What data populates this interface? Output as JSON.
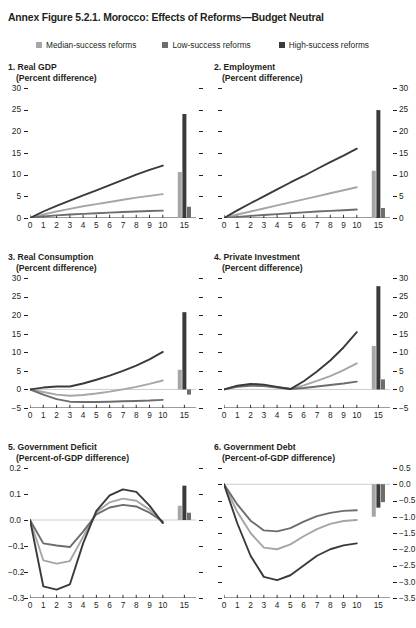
{
  "figure": {
    "title": "Annex Figure 5.2.1. Morocco: Effects of Reforms—Budget Neutral"
  },
  "legend": {
    "items": [
      {
        "label": "Median-success reforms",
        "color": "#a6a6a6",
        "key": "median"
      },
      {
        "label": "Low-success reforms",
        "color": "#6d6d6d",
        "key": "low"
      },
      {
        "label": "High-success reforms",
        "color": "#3a3a3a",
        "key": "high"
      }
    ]
  },
  "colors": {
    "median": "#a6a6a6",
    "low": "#6d6d6d",
    "high": "#3a3a3a",
    "axis": "#231f20",
    "zeroline": "#bfbfbf"
  },
  "chart_data": [
    {
      "type": "line",
      "panel": 1,
      "title": "1. Real GDP",
      "subtitle": "(Percent difference)",
      "xlabel": "",
      "ylabel": "",
      "ylim": [
        0,
        30
      ],
      "yticks": [
        0,
        5,
        10,
        15,
        20,
        25,
        30
      ],
      "ytick_labels": [
        "0",
        "5",
        "10",
        "15",
        "20",
        "25",
        "30"
      ],
      "axis_side": "left",
      "x": [
        0,
        1,
        2,
        3,
        4,
        5,
        6,
        7,
        8,
        9,
        10
      ],
      "xtick_labels": [
        "0",
        "1",
        "2",
        "3",
        "4",
        "5",
        "6",
        "7",
        "8",
        "9",
        "10",
        "15"
      ],
      "grid": false,
      "zero_line": false,
      "series": [
        {
          "name": "High-success reforms",
          "key": "high",
          "values": [
            0,
            1.5,
            2.8,
            4.0,
            5.2,
            6.4,
            7.6,
            8.8,
            10.0,
            11.1,
            12.1
          ]
        },
        {
          "name": "Median-success reforms",
          "key": "median",
          "values": [
            0,
            0.8,
            1.5,
            2.1,
            2.7,
            3.2,
            3.7,
            4.2,
            4.7,
            5.1,
            5.5
          ]
        },
        {
          "name": "Low-success reforms",
          "key": "low",
          "values": [
            0,
            0.35,
            0.6,
            0.8,
            0.95,
            1.1,
            1.25,
            1.4,
            1.5,
            1.6,
            1.7
          ]
        }
      ],
      "bars": {
        "x_label": "15",
        "values": [
          {
            "key": "median",
            "value": 10.6
          },
          {
            "key": "high",
            "value": 24.0
          },
          {
            "key": "low",
            "value": 2.6
          }
        ]
      }
    },
    {
      "type": "line",
      "panel": 2,
      "title": "2. Employment",
      "subtitle": "(Percent difference)",
      "xlabel": "",
      "ylabel": "",
      "ylim": [
        0,
        30
      ],
      "yticks": [
        0,
        5,
        10,
        15,
        20,
        25,
        30
      ],
      "ytick_labels": [
        "0",
        "5",
        "10",
        "15",
        "20",
        "25",
        "30"
      ],
      "axis_side": "right",
      "x": [
        0,
        1,
        2,
        3,
        4,
        5,
        6,
        7,
        8,
        9,
        10
      ],
      "xtick_labels": [
        "0",
        "1",
        "2",
        "3",
        "4",
        "5",
        "6",
        "7",
        "8",
        "9",
        "10",
        "15"
      ],
      "grid": false,
      "zero_line": false,
      "series": [
        {
          "name": "High-success reforms",
          "key": "high",
          "values": [
            0,
            1.75,
            3.4,
            5.0,
            6.6,
            8.2,
            9.7,
            11.3,
            12.9,
            14.4,
            16.0
          ]
        },
        {
          "name": "Median-success reforms",
          "key": "median",
          "values": [
            0,
            0.8,
            1.5,
            2.2,
            2.9,
            3.6,
            4.3,
            5.0,
            5.7,
            6.4,
            7.1
          ]
        },
        {
          "name": "Low-success reforms",
          "key": "low",
          "values": [
            0,
            0.25,
            0.5,
            0.7,
            0.9,
            1.1,
            1.3,
            1.5,
            1.65,
            1.8,
            1.95
          ]
        }
      ],
      "bars": {
        "x_label": "15",
        "values": [
          {
            "key": "median",
            "value": 10.9
          },
          {
            "key": "high",
            "value": 24.9
          },
          {
            "key": "low",
            "value": 2.3
          }
        ]
      }
    },
    {
      "type": "line",
      "panel": 3,
      "title": "3. Real Consumption",
      "subtitle": "(Percent difference)",
      "xlabel": "",
      "ylabel": "",
      "ylim": [
        -5,
        30
      ],
      "yticks": [
        -5,
        0,
        5,
        10,
        15,
        20,
        25,
        30
      ],
      "ytick_labels": [
        "-5",
        "0",
        "5",
        "10",
        "15",
        "20",
        "25",
        "30"
      ],
      "axis_side": "left",
      "x": [
        0,
        1,
        2,
        3,
        4,
        5,
        6,
        7,
        8,
        9,
        10
      ],
      "xtick_labels": [
        "0",
        "1",
        "2",
        "3",
        "4",
        "5",
        "6",
        "7",
        "8",
        "9",
        "10",
        "15"
      ],
      "grid": false,
      "zero_line": true,
      "series": [
        {
          "name": "High-success reforms",
          "key": "high",
          "values": [
            0,
            0.5,
            0.8,
            0.8,
            1.6,
            2.6,
            3.7,
            5.0,
            6.4,
            8.1,
            10.1
          ]
        },
        {
          "name": "Median-success reforms",
          "key": "median",
          "values": [
            0,
            -0.7,
            -1.4,
            -1.7,
            -1.5,
            -1.1,
            -0.6,
            0.0,
            0.7,
            1.5,
            2.4
          ]
        },
        {
          "name": "Low-success reforms",
          "key": "low",
          "values": [
            0,
            -1.4,
            -2.6,
            -3.3,
            -3.4,
            -3.4,
            -3.3,
            -3.2,
            -3.1,
            -3.0,
            -2.8
          ]
        }
      ],
      "bars": {
        "x_label": "15",
        "values": [
          {
            "key": "median",
            "value": 5.3
          },
          {
            "key": "high",
            "value": 20.8
          },
          {
            "key": "low",
            "value": -1.4
          }
        ]
      }
    },
    {
      "type": "line",
      "panel": 4,
      "title": "4. Private Investment",
      "subtitle": "(Percent difference)",
      "xlabel": "",
      "ylabel": "",
      "ylim": [
        -5,
        30
      ],
      "yticks": [
        -5,
        0,
        5,
        10,
        15,
        20,
        25,
        30
      ],
      "ytick_labels": [
        "-5",
        "0",
        "5",
        "10",
        "15",
        "20",
        "25",
        "30"
      ],
      "axis_side": "right",
      "x": [
        0,
        1,
        2,
        3,
        4,
        5,
        6,
        7,
        8,
        9,
        10
      ],
      "xtick_labels": [
        "0",
        "1",
        "2",
        "3",
        "4",
        "5",
        "6",
        "7",
        "8",
        "9",
        "10",
        "15"
      ],
      "grid": false,
      "zero_line": true,
      "series": [
        {
          "name": "High-success reforms",
          "key": "high",
          "values": [
            0,
            1.0,
            1.5,
            1.3,
            0.7,
            0.1,
            2.2,
            4.8,
            7.8,
            11.3,
            15.4
          ]
        },
        {
          "name": "Median-success reforms",
          "key": "median",
          "values": [
            0,
            0.9,
            1.3,
            1.1,
            0.6,
            0.1,
            1.1,
            2.3,
            3.6,
            5.2,
            7.0
          ]
        },
        {
          "name": "Low-success reforms",
          "key": "low",
          "values": [
            0,
            0.7,
            1.0,
            0.9,
            0.5,
            0.1,
            0.4,
            0.8,
            1.2,
            1.6,
            2.1
          ]
        }
      ],
      "bars": {
        "x_label": "15",
        "values": [
          {
            "key": "median",
            "value": 11.7
          },
          {
            "key": "high",
            "value": 27.8
          },
          {
            "key": "low",
            "value": 2.7
          }
        ]
      }
    },
    {
      "type": "line",
      "panel": 5,
      "title": "5. Government Deficit",
      "subtitle": "(Percent-of-GDP difference)",
      "xlabel": "",
      "ylabel": "",
      "ylim": [
        -0.3,
        0.2
      ],
      "yticks": [
        -0.3,
        -0.2,
        -0.1,
        0.0,
        0.1,
        0.2
      ],
      "ytick_labels": [
        "-0.3",
        "-0.2",
        "-0.1",
        "0.0",
        "0.1",
        "0.2"
      ],
      "axis_side": "left",
      "x": [
        0,
        1,
        2,
        3,
        4,
        5,
        6,
        7,
        8,
        9,
        10
      ],
      "xtick_labels": [
        "0",
        "1",
        "2",
        "3",
        "4",
        "5",
        "6",
        "7",
        "8",
        "9",
        "10",
        "15"
      ],
      "grid": false,
      "zero_line": true,
      "series": [
        {
          "name": "High-success reforms",
          "key": "high",
          "values": [
            0,
            -0.255,
            -0.268,
            -0.248,
            -0.09,
            0.035,
            0.095,
            0.118,
            0.108,
            0.055,
            -0.012
          ]
        },
        {
          "name": "Median-success reforms",
          "key": "median",
          "values": [
            0,
            -0.155,
            -0.168,
            -0.158,
            -0.065,
            0.03,
            0.068,
            0.082,
            0.074,
            0.04,
            -0.008
          ]
        },
        {
          "name": "Low-success reforms",
          "key": "low",
          "values": [
            0,
            -0.09,
            -0.098,
            -0.104,
            -0.045,
            0.022,
            0.048,
            0.058,
            0.052,
            0.028,
            -0.006
          ]
        }
      ],
      "bars": {
        "x_label": "15",
        "values": [
          {
            "key": "median",
            "value": 0.055
          },
          {
            "key": "high",
            "value": 0.132
          },
          {
            "key": "low",
            "value": 0.028
          }
        ]
      }
    },
    {
      "type": "line",
      "panel": 6,
      "title": "6. Government Debt",
      "subtitle": "(Percent-of-GDP difference)",
      "xlabel": "",
      "ylabel": "",
      "ylim": [
        -3.5,
        0.5
      ],
      "yticks": [
        -3.5,
        -3.0,
        -2.5,
        -2.0,
        -1.5,
        -1.0,
        -0.5,
        0.0,
        0.5
      ],
      "ytick_labels": [
        "-3.5",
        "-3.0",
        "-2.5",
        "-2.0",
        "-1.5",
        "-1.0",
        "-0.5",
        "0.0",
        "0.5"
      ],
      "axis_side": "right",
      "x": [
        0,
        1,
        2,
        3,
        4,
        5,
        6,
        7,
        8,
        9,
        10
      ],
      "xtick_labels": [
        "0",
        "1",
        "2",
        "3",
        "4",
        "5",
        "6",
        "7",
        "8",
        "9",
        "10",
        "15"
      ],
      "grid": false,
      "zero_line": true,
      "series": [
        {
          "name": "High-success reforms",
          "key": "high",
          "values": [
            0,
            -1.2,
            -2.2,
            -2.85,
            -2.95,
            -2.8,
            -2.5,
            -2.2,
            -2.0,
            -1.88,
            -1.82
          ]
        },
        {
          "name": "Median-success reforms",
          "key": "median",
          "values": [
            0,
            -0.85,
            -1.5,
            -1.95,
            -2.0,
            -1.85,
            -1.6,
            -1.38,
            -1.22,
            -1.13,
            -1.1
          ]
        },
        {
          "name": "Low-success reforms",
          "key": "low",
          "values": [
            0,
            -0.62,
            -1.12,
            -1.42,
            -1.45,
            -1.35,
            -1.15,
            -0.98,
            -0.88,
            -0.82,
            -0.8
          ]
        }
      ],
      "bars": {
        "x_label": "15",
        "values": [
          {
            "key": "median",
            "value": -1.0
          },
          {
            "key": "high",
            "value": -0.72
          },
          {
            "key": "low",
            "value": -0.55
          }
        ]
      }
    }
  ]
}
